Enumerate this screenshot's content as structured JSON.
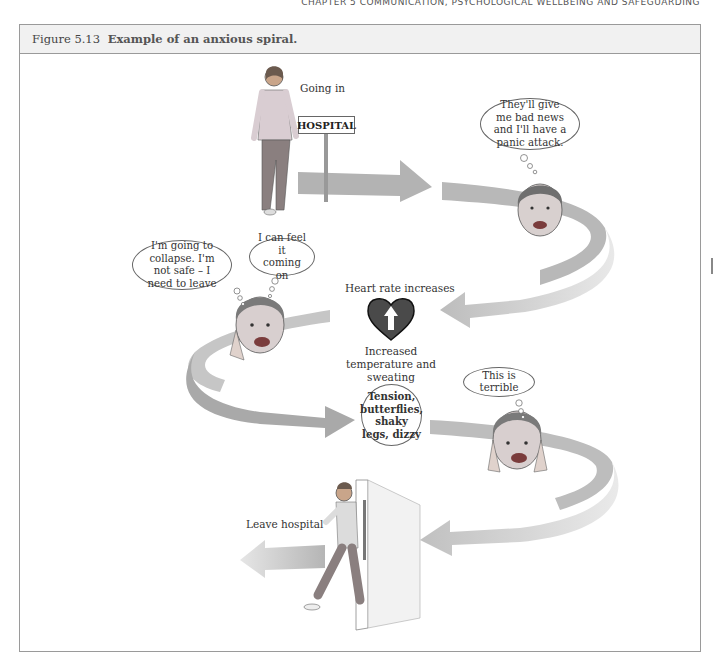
{
  "running_header": "CHAPTER 5 COMMUNICATION, PSYCHOLOGICAL WELLBEING AND SAFEGUARDING",
  "figure": {
    "number": "Figure 5.13",
    "caption": "Example of an anxious spiral."
  },
  "diagram": {
    "steps": [
      {
        "label": "Going in",
        "sign": "HOSPITAL"
      },
      {
        "thought": "They'll give me bad news and I'll have a panic attack."
      },
      {
        "label_top": "Heart rate increases",
        "label_bottom": "Increased temperature and sweating",
        "icon": "heart-up-arrow-icon"
      },
      {
        "thoughts": [
          "I'm going to collapse. I'm not safe – I need to leave",
          "I can feel it coming on"
        ]
      },
      {
        "symptoms": "Tension, butterflies, shaky legs, dizzy"
      },
      {
        "thought": "This is terrible"
      },
      {
        "label": "Leave hospital"
      }
    ],
    "colors": {
      "arrow": "#b8b8b8",
      "arrow_light": "#dcdcdc",
      "heart": "#4a4a4a",
      "border": "#9a9a9a",
      "title_bar": "#f1f1f1"
    }
  }
}
